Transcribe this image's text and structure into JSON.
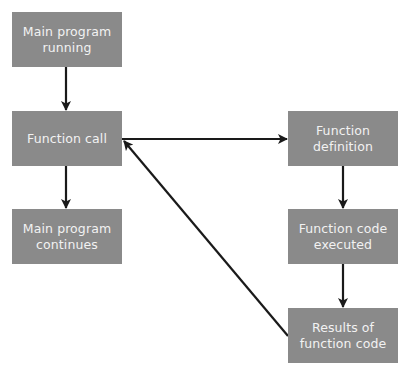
{
  "diagram": {
    "type": "flowchart",
    "colors": {
      "node_fill": "#8a8a8a",
      "node_text": "#f2f2f2",
      "edge": "#1a1a1a",
      "background": "#ffffff"
    },
    "nodes": [
      {
        "id": "main_running",
        "label": "Main program\nrunning"
      },
      {
        "id": "function_call",
        "label": "Function call"
      },
      {
        "id": "main_continues",
        "label": "Main program\ncontinues"
      },
      {
        "id": "function_definition",
        "label": "Function\ndefinition"
      },
      {
        "id": "function_executed",
        "label": "Function code\nexecuted"
      },
      {
        "id": "function_results",
        "label": "Results of\nfunction code"
      }
    ],
    "edges": [
      {
        "from": "main_running",
        "to": "function_call"
      },
      {
        "from": "function_call",
        "to": "main_continues"
      },
      {
        "from": "function_call",
        "to": "function_definition"
      },
      {
        "from": "function_definition",
        "to": "function_executed"
      },
      {
        "from": "function_executed",
        "to": "function_results"
      },
      {
        "from": "function_results",
        "to": "function_call"
      }
    ]
  }
}
